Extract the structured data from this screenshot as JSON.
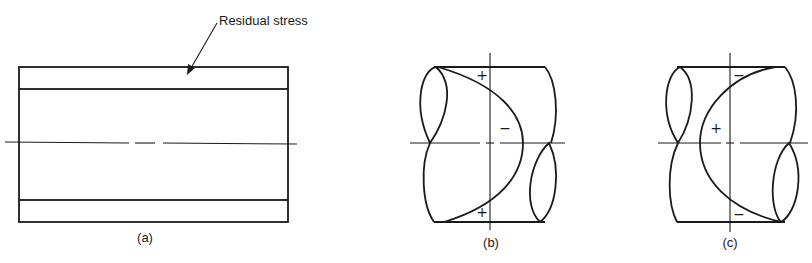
{
  "figure": {
    "panels": [
      {
        "id": "a",
        "caption": "(a)",
        "annotation": "Residual stress",
        "description": "Longitudinal section of a tube with stippled residual-stress layers at outer surfaces"
      },
      {
        "id": "b",
        "caption": "(b)",
        "signs": {
          "top": "+",
          "middle": "−",
          "bottom": "+"
        },
        "description": "Twisted section with hatched lobes; parabolic stress distribution, compressive at center"
      },
      {
        "id": "c",
        "caption": "(c)",
        "signs": {
          "top": "−",
          "middle": "+",
          "bottom": "−"
        },
        "description": "Twisted section with hatched lobes; reversed parabolic stress distribution, tensile at center"
      }
    ],
    "colors": {
      "line": "#1a1a1a",
      "background": "#ffffff",
      "stipple": "#9a9a9a"
    }
  }
}
